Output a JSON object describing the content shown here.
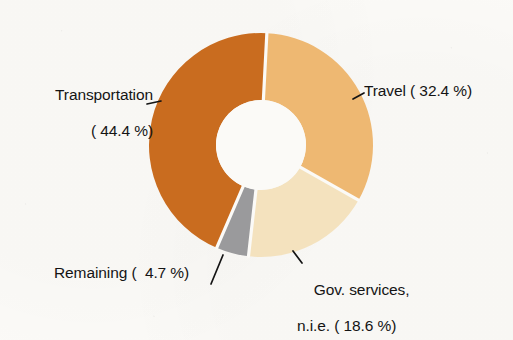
{
  "background_color": "#fbfaf7",
  "text_color": "#141414",
  "chart_data": {
    "type": "pie",
    "variant": "donut",
    "title": "",
    "subtitle": "",
    "xlabel": "",
    "ylabel": "",
    "legend_position": "none",
    "labels_outside": true,
    "units": "percent",
    "total": 100.1,
    "start_angle_deg": 3,
    "direction": "clockwise",
    "center": {
      "x": 261,
      "y": 145
    },
    "outer_radius": 112,
    "inner_radius": 45,
    "categories": [
      "Travel",
      "Gov. services, n.i.e.",
      "Remaining",
      "Transportation"
    ],
    "values": [
      32.4,
      18.6,
      4.7,
      44.4
    ],
    "colors": [
      "#eeb872",
      "#f4e2be",
      "#9a9a9c",
      "#c96c1f"
    ],
    "slices": [
      {
        "name": "Travel",
        "value": 32.4,
        "color": "#eeb872",
        "label_text": "Travel ( 32.4 %)"
      },
      {
        "name": "Gov. services, n.i.e.",
        "value": 18.6,
        "color": "#f4e2be",
        "label_line1": "Gov. services,",
        "label_line2": "n.i.e. ( 18.6 %)"
      },
      {
        "name": "Remaining",
        "value": 4.7,
        "color": "#9a9a9c",
        "label_text": "Remaining (  4.7 %)"
      },
      {
        "name": "Transportation",
        "value": 44.4,
        "color": "#c96c1f",
        "label_line1": "Transportation",
        "label_line2": "( 44.4 %)"
      }
    ]
  },
  "labels": {
    "transportation_line1": "Transportation",
    "transportation_line2": "( 44.4 %)",
    "travel": "Travel ( 32.4 %)",
    "gov_line1": "Gov. services,",
    "gov_line2": "n.i.e. ( 18.6 %)",
    "remaining": "Remaining (  4.7 %)"
  }
}
